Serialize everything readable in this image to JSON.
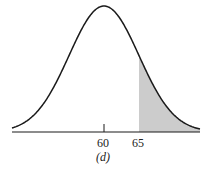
{
  "chart_data": {
    "type": "area",
    "title": "",
    "caption": "(d)",
    "distribution": "normal",
    "mean": 60,
    "sd": 5,
    "shaded_region": {
      "from": 65,
      "to": "inf",
      "color": "#cccccc"
    },
    "x_ticks": [
      60,
      65
    ],
    "xlabel": "",
    "ylabel": "",
    "grid": false,
    "legend": null
  },
  "labels": {
    "tick_60": "60",
    "tick_65": "65",
    "caption": "(d)"
  },
  "colors": {
    "curve": "#1a1a1a",
    "shade": "#cccccc",
    "axis": "#1a1a1a"
  }
}
